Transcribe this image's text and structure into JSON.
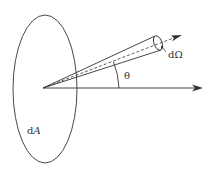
{
  "diagram": {
    "labels": {
      "area": "dA",
      "area_d": "d",
      "area_A": "A",
      "solid_angle": "dΩ",
      "angle": "θ"
    },
    "colors": {
      "stroke": "#333333",
      "background": "#ffffff"
    }
  }
}
